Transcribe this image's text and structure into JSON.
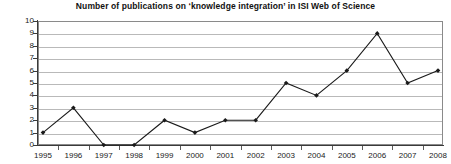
{
  "chart_data": {
    "type": "line",
    "title": "Number of publications on ‘knowledge integration’ in ISI Web of Science",
    "xlabel": "",
    "ylabel": "",
    "categories": [
      "1995",
      "1996",
      "1997",
      "1998",
      "1999",
      "2000",
      "2001",
      "2002",
      "2003",
      "2004",
      "2005",
      "2006",
      "2007",
      "2008"
    ],
    "values": [
      1,
      3,
      0,
      0,
      2,
      1,
      2,
      2,
      5,
      4,
      6,
      9,
      5,
      6
    ],
    "ylim": [
      0,
      10
    ],
    "y_ticks": [
      "0",
      "1",
      "2",
      "3",
      "4",
      "5",
      "6",
      "7",
      "8",
      "9",
      "10"
    ],
    "grid": true,
    "legend": "none",
    "marker": "filled-diamond",
    "line_color": "#1a1a1a",
    "grid_color": "#b9b9b9",
    "axis_color": "#3a3a3a"
  }
}
